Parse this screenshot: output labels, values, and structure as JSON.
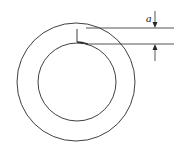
{
  "diagram": {
    "type": "annular ring with radial crack",
    "dimension_label": "a",
    "colors": {
      "stroke": "#2a2a2a",
      "background": "#ffffff"
    },
    "outer_circle": {
      "cx": 76,
      "cy": 82,
      "r": 59
    },
    "inner_circle": {
      "cx": 77,
      "cy": 82,
      "r": 39
    },
    "crack": {
      "x": 77,
      "y1": 29,
      "y2": 42
    }
  }
}
